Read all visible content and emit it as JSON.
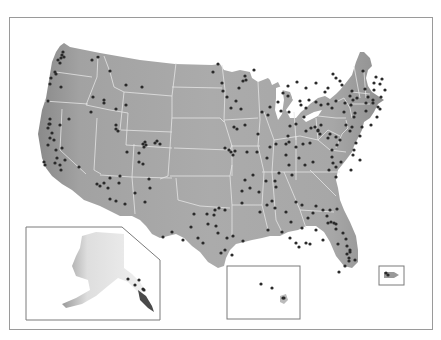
{
  "map": {
    "title": "",
    "land_color": "#a9a9a9",
    "land_color_west": "#8e8e8e",
    "border_color": "#e6e6e6",
    "dot_color": "#2a2a2a",
    "inset_border": "#7a7a7a",
    "insets": [
      {
        "name": "Alaska"
      },
      {
        "name": "Hawaii"
      },
      {
        "name": "Puerto Rico"
      }
    ]
  },
  "chart_data": {
    "type": "scatter",
    "title": "",
    "points": [
      [
        63,
        52
      ],
      [
        62,
        55
      ],
      [
        64,
        57
      ],
      [
        61,
        58
      ],
      [
        58,
        60
      ],
      [
        60,
        63
      ],
      [
        92,
        60
      ],
      [
        98,
        57
      ],
      [
        110,
        71
      ],
      [
        126,
        85
      ],
      [
        142,
        87
      ],
      [
        93,
        97
      ],
      [
        104,
        100
      ],
      [
        104,
        103
      ],
      [
        116,
        109
      ],
      [
        126,
        105
      ],
      [
        91,
        112
      ],
      [
        55,
        72
      ],
      [
        56,
        74
      ],
      [
        51,
        78
      ],
      [
        50,
        84
      ],
      [
        61,
        87
      ],
      [
        48,
        101
      ],
      [
        50,
        119
      ],
      [
        50,
        124
      ],
      [
        48,
        128
      ],
      [
        52,
        133
      ],
      [
        50,
        138
      ],
      [
        54,
        140
      ],
      [
        48,
        145
      ],
      [
        56,
        150
      ],
      [
        57,
        158
      ],
      [
        61,
        170
      ],
      [
        49,
        124
      ],
      [
        60,
        125
      ],
      [
        69,
        119
      ],
      [
        62,
        148
      ],
      [
        65,
        160
      ],
      [
        55,
        163
      ],
      [
        60,
        165
      ],
      [
        44,
        162
      ],
      [
        45,
        165
      ],
      [
        79,
        167
      ],
      [
        116,
        129
      ],
      [
        118,
        131
      ],
      [
        127,
        152
      ],
      [
        143,
        144
      ],
      [
        144,
        147
      ],
      [
        145,
        142
      ],
      [
        146,
        145
      ],
      [
        155,
        143
      ],
      [
        157,
        141
      ],
      [
        160,
        144
      ],
      [
        139,
        153
      ],
      [
        139,
        162
      ],
      [
        143,
        164
      ],
      [
        116,
        125
      ],
      [
        97,
        184
      ],
      [
        100,
        186
      ],
      [
        104,
        183
      ],
      [
        108,
        188
      ],
      [
        119,
        183
      ],
      [
        120,
        176
      ],
      [
        110,
        178
      ],
      [
        116,
        201
      ],
      [
        110,
        199
      ],
      [
        135,
        193
      ],
      [
        149,
        179
      ],
      [
        150,
        188
      ],
      [
        145,
        202
      ],
      [
        125,
        204
      ],
      [
        227,
        97
      ],
      [
        239,
        88
      ],
      [
        243,
        81
      ],
      [
        246,
        80
      ],
      [
        245,
        76
      ],
      [
        241,
        109
      ],
      [
        236,
        101
      ],
      [
        231,
        108
      ],
      [
        254,
        70
      ],
      [
        218,
        64
      ],
      [
        213,
        72
      ],
      [
        222,
        83
      ],
      [
        223,
        91
      ],
      [
        234,
        127
      ],
      [
        237,
        129
      ],
      [
        245,
        125
      ],
      [
        258,
        134
      ],
      [
        225,
        148
      ],
      [
        229,
        150
      ],
      [
        235,
        151
      ],
      [
        247,
        152
      ],
      [
        257,
        152
      ],
      [
        267,
        158
      ],
      [
        266,
        181
      ],
      [
        231,
        152
      ],
      [
        233,
        155
      ],
      [
        270,
        147
      ],
      [
        276,
        144
      ],
      [
        286,
        144
      ],
      [
        303,
        144
      ],
      [
        310,
        143
      ],
      [
        305,
        165
      ],
      [
        289,
        142
      ],
      [
        296,
        147
      ],
      [
        286,
        155
      ],
      [
        299,
        158
      ],
      [
        313,
        162
      ],
      [
        332,
        150
      ],
      [
        332,
        157
      ],
      [
        315,
        127
      ],
      [
        318,
        130
      ],
      [
        318,
        131
      ],
      [
        320,
        134
      ],
      [
        330,
        134
      ],
      [
        336,
        137
      ],
      [
        340,
        140
      ],
      [
        328,
        138
      ],
      [
        337,
        145
      ],
      [
        355,
        113
      ],
      [
        354,
        117
      ],
      [
        352,
        127
      ],
      [
        350,
        131
      ],
      [
        346,
        125
      ],
      [
        351,
        105
      ],
      [
        353,
        100
      ],
      [
        350,
        96
      ],
      [
        345,
        103
      ],
      [
        344,
        112
      ],
      [
        357,
        98
      ],
      [
        352,
        91
      ],
      [
        332,
        108
      ],
      [
        328,
        104
      ],
      [
        336,
        101
      ],
      [
        321,
        105
      ],
      [
        316,
        102
      ],
      [
        309,
        100
      ],
      [
        300,
        101
      ],
      [
        301,
        105
      ],
      [
        306,
        108
      ],
      [
        321,
        125
      ],
      [
        311,
        128
      ],
      [
        306,
        131
      ],
      [
        304,
        117
      ],
      [
        296,
        124
      ],
      [
        290,
        126
      ],
      [
        288,
        136
      ],
      [
        289,
        112
      ],
      [
        281,
        111
      ],
      [
        278,
        102
      ],
      [
        270,
        107
      ],
      [
        268,
        115
      ],
      [
        262,
        112
      ],
      [
        283,
        93
      ],
      [
        288,
        96
      ],
      [
        297,
        82
      ],
      [
        288,
        86
      ],
      [
        306,
        88
      ],
      [
        316,
        83
      ],
      [
        325,
        92
      ],
      [
        328,
        88
      ],
      [
        342,
        85
      ],
      [
        340,
        81
      ],
      [
        333,
        74
      ],
      [
        336,
        78
      ],
      [
        363,
        71
      ],
      [
        365,
        89
      ],
      [
        368,
        97
      ],
      [
        373,
        100
      ],
      [
        373,
        103
      ],
      [
        366,
        103
      ],
      [
        366,
        111
      ],
      [
        374,
        83
      ],
      [
        374,
        90
      ],
      [
        380,
        84
      ],
      [
        376,
        77
      ],
      [
        382,
        79
      ],
      [
        385,
        90
      ],
      [
        381,
        97
      ],
      [
        378,
        107
      ],
      [
        380,
        109
      ],
      [
        377,
        117
      ],
      [
        371,
        125
      ],
      [
        362,
        127
      ],
      [
        360,
        136
      ],
      [
        356,
        143
      ],
      [
        354,
        150
      ],
      [
        353,
        155
      ],
      [
        360,
        160
      ],
      [
        341,
        162
      ],
      [
        336,
        167
      ],
      [
        333,
        163
      ],
      [
        329,
        170
      ],
      [
        336,
        177
      ],
      [
        351,
        170
      ],
      [
        289,
        165
      ],
      [
        292,
        175
      ],
      [
        279,
        173
      ],
      [
        275,
        181
      ],
      [
        276,
        187
      ],
      [
        272,
        201
      ],
      [
        253,
        175
      ],
      [
        250,
        188
      ],
      [
        242,
        191
      ],
      [
        245,
        180
      ],
      [
        259,
        192
      ],
      [
        242,
        203
      ],
      [
        225,
        210
      ],
      [
        215,
        210
      ],
      [
        214,
        215
      ],
      [
        219,
        208
      ],
      [
        207,
        214
      ],
      [
        208,
        224
      ],
      [
        191,
        227
      ],
      [
        198,
        238
      ],
      [
        203,
        243
      ],
      [
        163,
        237
      ],
      [
        172,
        232
      ],
      [
        183,
        240
      ],
      [
        260,
        212
      ],
      [
        267,
        205
      ],
      [
        275,
        208
      ],
      [
        286,
        212
      ],
      [
        296,
        202
      ],
      [
        302,
        205
      ],
      [
        316,
        206
      ],
      [
        337,
        209
      ],
      [
        331,
        222
      ],
      [
        336,
        224
      ],
      [
        336,
        229
      ],
      [
        343,
        233
      ],
      [
        346,
        239
      ],
      [
        347,
        246
      ],
      [
        350,
        250
      ],
      [
        347,
        254
      ],
      [
        349,
        258
      ],
      [
        349,
        261
      ],
      [
        345,
        266
      ],
      [
        339,
        272
      ],
      [
        355,
        260
      ],
      [
        350,
        252
      ],
      [
        338,
        244
      ],
      [
        328,
        223
      ],
      [
        323,
        210
      ],
      [
        330,
        210
      ],
      [
        327,
        216
      ],
      [
        313,
        213
      ],
      [
        308,
        218
      ],
      [
        302,
        228
      ],
      [
        291,
        222
      ],
      [
        268,
        230
      ],
      [
        243,
        241
      ],
      [
        233,
        236
      ],
      [
        227,
        238
      ],
      [
        218,
        233
      ],
      [
        221,
        253
      ],
      [
        225,
        250
      ],
      [
        282,
        232
      ],
      [
        290,
        238
      ],
      [
        296,
        243
      ],
      [
        299,
        247
      ],
      [
        306,
        243
      ],
      [
        310,
        244
      ],
      [
        334,
        223
      ],
      [
        316,
        230
      ],
      [
        323,
        240
      ],
      [
        232,
        255
      ],
      [
        216,
        226
      ],
      [
        194,
        214
      ],
      [
        128,
        279
      ],
      [
        139,
        280
      ],
      [
        135,
        285
      ],
      [
        143,
        289
      ],
      [
        144,
        290
      ],
      [
        261,
        284
      ],
      [
        272,
        288
      ],
      [
        283,
        298
      ],
      [
        284,
        298
      ],
      [
        386,
        273
      ],
      [
        388,
        275
      ]
    ]
  }
}
